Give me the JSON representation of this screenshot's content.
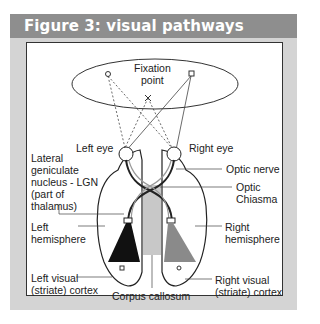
{
  "figure": {
    "title": "Figure 3: visual pathways",
    "colors": {
      "header_bg": "#8e8e8e",
      "panel_bg": "#d4d4d4",
      "frame_border": "#333333",
      "left_radiation": "#111111",
      "right_radiation": "#8a8a8a",
      "corpus_callosum": "#c8c8c8"
    }
  },
  "labels": {
    "fixation_point": "Fixation\npoint",
    "left_eye": "Left eye",
    "right_eye": "Right eye",
    "lgn": "Lateral\ngeniculate\nnucleus - LGN\n(part of\nthalamus)",
    "optic_nerve": "Optic nerve",
    "optic_chiasma": "Optic\nChiasma",
    "left_hemisphere": "Left\nhemisphere",
    "right_hemisphere": "Right\nhemisphere",
    "left_visual_cortex": "Left visual\n(striate) cortex",
    "right_visual_cortex": "Right visual\n(striate) cortex",
    "corpus_callosum": "Corpus callosum"
  }
}
